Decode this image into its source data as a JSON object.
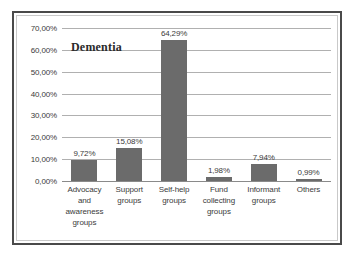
{
  "chart_data": {
    "type": "bar",
    "title": "Dementia",
    "xlabel": "",
    "ylabel": "",
    "categories": [
      "Advocacy and awareness groups",
      "Support groups",
      "Self-help groups",
      "Fund collecting groups",
      "Informant groups",
      "Others"
    ],
    "values": [
      9.72,
      15.08,
      64.29,
      1.98,
      7.94,
      0.99
    ],
    "value_labels": [
      "9,72%",
      "15,08%",
      "64,29%",
      "1,98%",
      "7,94%",
      "0,99%"
    ],
    "ylim": [
      0,
      70
    ],
    "ytick_labels": [
      "0,00%",
      "10,00%",
      "20,00%",
      "30,00%",
      "40,00%",
      "50,00%",
      "60,00%",
      "70,00%"
    ],
    "ytick_values": [
      0,
      10,
      20,
      30,
      40,
      50,
      60,
      70
    ],
    "grid": true,
    "legend": "none",
    "bar_color": "#6b6b6b",
    "gridline_color": "#b0b0b0",
    "frame_color": "#4a4a4a",
    "background_color": "#ffffff"
  }
}
